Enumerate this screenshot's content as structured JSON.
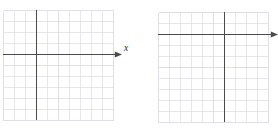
{
  "figure": {
    "type": "blank-coordinate-grids",
    "background_color": "#ffffff",
    "grid_line_color": "#dcdce4",
    "grid_major_color": "#d0d0da",
    "axis_color": "#4a4a4a",
    "label_color": "#2b2b2b",
    "panel_count": 2
  },
  "panels": [
    {
      "id": "left-graph",
      "name": "Blank coordinate plane (left)",
      "x_axis_label": "x",
      "y_axis_label": "y",
      "columns": 10,
      "rows": 10,
      "cell_size": 11,
      "origin_col": 3,
      "origin_row": 4,
      "x_arrow": "right",
      "y_arrow": "up",
      "grid_left": 3,
      "grid_top": 10,
      "grid_width": 110,
      "grid_height": 110
    },
    {
      "id": "right-graph",
      "name": "Blank coordinate plane (right)",
      "x_axis_label": "x",
      "y_axis_label": "y",
      "columns": 10,
      "rows": 10,
      "cell_size": 11,
      "origin_col": 6,
      "origin_row": 2,
      "x_arrow": "right",
      "y_arrow": "up",
      "grid_left": 158,
      "grid_top": 12,
      "grid_width": 110,
      "grid_height": 110
    }
  ],
  "caption": {
    "visible_fragment": "",
    "note": "cut-off faint text row at bottom edge"
  }
}
